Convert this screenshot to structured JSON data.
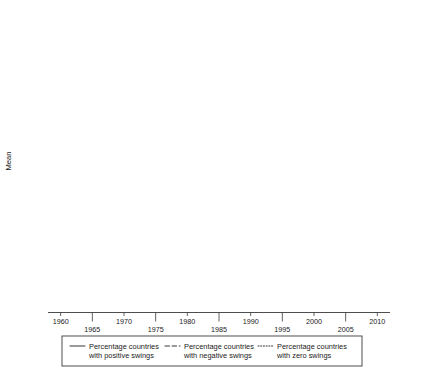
{
  "chart_data": {
    "type": "line",
    "title": "",
    "xlabel": "",
    "ylabel": "Mean",
    "xlim": [
      1958,
      2012
    ],
    "ylim": [
      0,
      100
    ],
    "grid": false,
    "reference_line_y": 50,
    "legend_position": "bottom",
    "x_ticks": [
      1960,
      1965,
      1970,
      1975,
      1980,
      1985,
      1990,
      1995,
      2000,
      2005,
      2010
    ],
    "x_tick_labels": [
      "1960",
      "1965",
      "1970",
      "1975",
      "1980",
      "1985",
      "1990",
      "1995",
      "2000",
      "2005",
      "2010"
    ],
    "y_ticks": [
      0,
      20,
      40,
      60,
      80,
      100
    ],
    "y_tick_labels": [
      "0.00",
      "20.00",
      "40.00",
      "60.00",
      "80.00",
      "100.00"
    ],
    "legend": [
      {
        "name": "Percentage countries with positive swings",
        "line_label_1": "Percentage countries",
        "line_label_2": "with positive swings",
        "style": "solid",
        "key": "positive"
      },
      {
        "name": "Percentage countries with negative swings",
        "line_label_1": "Percentage countries",
        "line_label_2": "with negative swings",
        "style": "dashed",
        "key": "negative"
      },
      {
        "name": "Percentage countries with zero swings",
        "line_label_1": "Percentage countries",
        "line_label_2": "with zero swings",
        "style": "dotted",
        "key": "zero"
      }
    ],
    "panels": [
      {
        "label": "Ethno-regionalists",
        "x": [
          1960,
          1965,
          1970,
          1975,
          1980,
          1985,
          1990,
          1995,
          2000,
          2005,
          2010
        ],
        "series": [
          {
            "name": "Percentage countries with positive swings",
            "key": "positive",
            "style": "solid",
            "values": [
              5.0,
              5.5,
              10.0,
              6.5,
              9.5,
              3.0,
              10.0,
              19.0,
              14.0,
              10.5,
              23.0
            ]
          },
          {
            "name": "Percentage countries with negative swings",
            "key": "negative",
            "style": "dashed",
            "values": [
              5.0,
              4.0,
              5.0,
              9.5,
              16.0,
              9.0,
              3.0,
              12.0,
              20.5,
              17.0,
              7.0
            ]
          },
          {
            "name": "Percentage countries with zero swings",
            "key": "zero",
            "style": "dotted",
            "values": [
              87.0,
              85.0,
              81.0,
              76.0,
              72.0,
              73.0,
              77.0,
              63.0,
              59.0,
              60.0,
              60.5
            ]
          }
        ]
      },
      {
        "label": "Far right",
        "x": [
          1960,
          1965,
          1970,
          1975,
          1980,
          1985,
          1990,
          1995,
          2000,
          2005,
          2010
        ],
        "series": [
          {
            "name": "Percentage countries with positive swings",
            "key": "positive",
            "style": "solid",
            "values": [
              0.5,
              1.5,
              7.0,
              22.5,
              9.0,
              18.0,
              27.5,
              24.0,
              18.0,
              29.5,
              42.0
            ]
          },
          {
            "name": "Percentage countries with negative swings",
            "key": "negative",
            "style": "dashed",
            "values": [
              33.0,
              33.0,
              24.0,
              9.0,
              3.5,
              17.0,
              12.0,
              22.0,
              30.5,
              25.0,
              20.0
            ]
          },
          {
            "name": "Percentage countries with zero swings",
            "key": "zero",
            "style": "dotted",
            "values": [
              65.0,
              66.0,
              68.0,
              68.5,
              67.0,
              63.0,
              51.0,
              45.0,
              27.0,
              22.0,
              28.0
            ]
          }
        ]
      },
      {
        "label": "Greens",
        "x": [
          1975,
          1980,
          1985,
          1990,
          1995,
          2000,
          2005,
          2010
        ],
        "series": [
          {
            "name": "Percentage countries with positive swings",
            "key": "positive",
            "style": "solid",
            "values": [
              0.0,
              22.0,
              30.0,
              46.0,
              37.0,
              29.0,
              45.0,
              32.0
            ]
          },
          {
            "name": "Percentage countries with negative swings",
            "key": "negative",
            "style": "dashed",
            "values": [
              0.0,
              4.0,
              5.5,
              14.0,
              25.0,
              17.0,
              12.5,
              27.0
            ]
          },
          {
            "name": "Percentage countries with zero swings",
            "key": "zero",
            "style": "dotted",
            "values": [
              98.0,
              72.0,
              64.0,
              49.0,
              42.0,
              45.0,
              44.0,
              31.0
            ]
          }
        ]
      }
    ]
  }
}
